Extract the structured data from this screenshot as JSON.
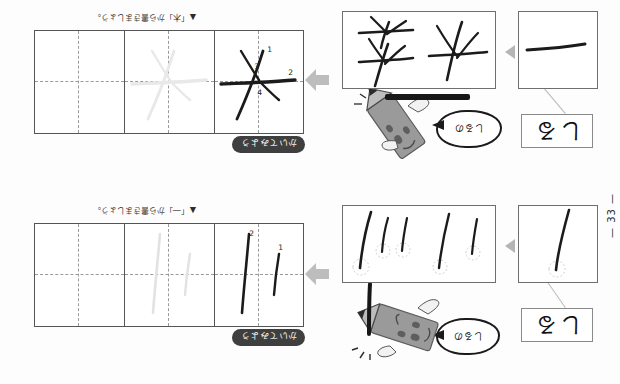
{
  "page": {
    "page_number": "— 33 —",
    "background_color": "#fdfdfd",
    "ink_color": "#1b1b1b",
    "rotation_degrees": 180
  },
  "rows": [
    {
      "id": "row-top",
      "char_card": {
        "text": "しる",
        "name": "character-card"
      },
      "speech_bubble": {
        "text": "しるの",
        "name": "speech-bubble"
      },
      "mascot": {
        "name": "pencil-mascot",
        "body_color": "#9a9a9a",
        "tip_color": "#4a4a4a"
      },
      "sample_box_1": {
        "name": "sample-box-single-stroke",
        "stroke_count": 1
      },
      "sample_box_2": {
        "name": "sample-box-multi-stroke",
        "stroke_count": 5
      },
      "badge": {
        "text": "かいてみよう",
        "color": "#3f3f3f"
      },
      "grid": {
        "cells": 3,
        "name": "practice-grid"
      },
      "practice_strokes": [
        {
          "label": "1",
          "cell": 0
        },
        {
          "label": "2",
          "cell": 0
        }
      ],
      "caption": {
        "marker": "▲",
        "text": "「―」から書きましょう。"
      }
    },
    {
      "id": "row-bottom",
      "char_card": {
        "text": "しる",
        "name": "character-card"
      },
      "speech_bubble": {
        "text": "しるの",
        "name": "speech-bubble"
      },
      "mascot": {
        "name": "pencil-mascot",
        "body_color": "#9a9a9a",
        "tip_color": "#4a4a4a"
      },
      "sample_box_1": {
        "name": "sample-box-horizontal-stroke",
        "stroke_count": 1
      },
      "sample_box_2": {
        "name": "sample-box-kanji-shapes",
        "stroke_count": 3
      },
      "badge": {
        "text": "かいてみよう",
        "color": "#3f3f3f"
      },
      "grid": {
        "cells": 3,
        "name": "practice-grid"
      },
      "practice_strokes": [
        {
          "label": "1",
          "cell": 0
        },
        {
          "label": "2",
          "cell": 0
        },
        {
          "label": "3",
          "cell": 0
        },
        {
          "label": "4",
          "cell": 0
        }
      ],
      "caption": {
        "marker": "▲",
        "text": "「木」から書きましょう。"
      }
    }
  ]
}
